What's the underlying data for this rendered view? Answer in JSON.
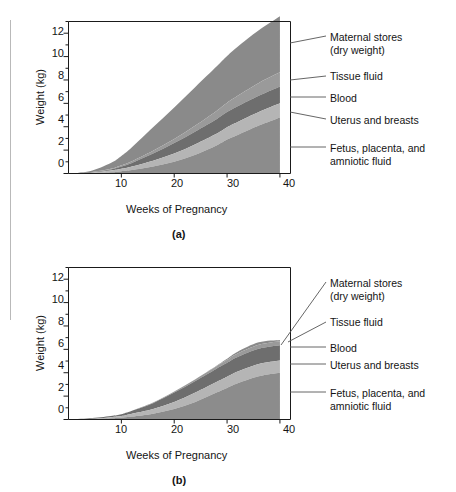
{
  "figure": {
    "panels": [
      {
        "tag": "(a)",
        "ylabel": "Weight (kg)",
        "xlabel": "Weeks of Pregnancy",
        "yticks": [
          "12",
          "10",
          "8",
          "6",
          "4",
          "2",
          "0"
        ],
        "xticks": [
          "10",
          "20",
          "30",
          "40"
        ],
        "legend": [
          "Maternal stores\n(dry weight)",
          "Tissue fluid",
          "Blood",
          "Uterus and breasts",
          "Fetus, placenta, and\namniotic fluid"
        ]
      },
      {
        "tag": "(b)",
        "ylabel": "Weight (kg)",
        "xlabel": "Weeks of Pregnancy",
        "yticks": [
          "12",
          "10",
          "8",
          "6",
          "4",
          "2",
          "0"
        ],
        "xticks": [
          "10",
          "20",
          "30",
          "40"
        ],
        "legend": [
          "Maternal stores\n(dry weight)",
          "Tissue fluid",
          "Blood",
          "Uterus and breasts",
          "Fetus, placenta, and\namniotic fluid"
        ]
      }
    ]
  },
  "colors": {
    "fetus": "#8c8c8c",
    "uterus": "#b5b5b5",
    "blood": "#6e6e6e",
    "tissue_fluid": "#9a9a9a",
    "maternal_stores": "#8a8a8a",
    "axis": "#1a1a1a",
    "leader": "#555555",
    "background": "#ffffff"
  },
  "chart_data": [
    {
      "type": "area",
      "id": "panel-a",
      "title": "(a)",
      "xlabel": "Weeks of Pregnancy",
      "ylabel": "Weight (kg)",
      "xlim": [
        0,
        42
      ],
      "ylim": [
        0,
        13
      ],
      "xticks": [
        10,
        20,
        30,
        40
      ],
      "yticks": [
        0,
        2,
        4,
        6,
        8,
        10,
        12
      ],
      "grid": false,
      "legend_position": "right-callouts",
      "stacked": true,
      "x": [
        0,
        4,
        8,
        10,
        12,
        16,
        20,
        24,
        28,
        30,
        32,
        36,
        40
      ],
      "series": [
        {
          "name": "Fetus, placenta, and amniotic fluid",
          "values": [
            0,
            0,
            0.1,
            0.2,
            0.3,
            0.6,
            1.0,
            1.6,
            2.4,
            2.9,
            3.3,
            4.1,
            4.8
          ]
        },
        {
          "name": "Uterus and breasts",
          "values": [
            0,
            0.05,
            0.15,
            0.2,
            0.3,
            0.5,
            0.7,
            0.9,
            1.0,
            1.05,
            1.1,
            1.15,
            1.2
          ]
        },
        {
          "name": "Blood",
          "values": [
            0,
            0.05,
            0.1,
            0.2,
            0.3,
            0.6,
            0.9,
            1.1,
            1.25,
            1.3,
            1.35,
            1.4,
            1.45
          ]
        },
        {
          "name": "Tissue fluid",
          "values": [
            0,
            0.0,
            0.05,
            0.1,
            0.15,
            0.25,
            0.35,
            0.5,
            0.7,
            0.8,
            0.9,
            1.1,
            1.2
          ]
        },
        {
          "name": "Maternal stores (dry weight)",
          "values": [
            0,
            0.1,
            0.5,
            0.8,
            1.2,
            2.0,
            2.7,
            3.3,
            3.8,
            4.0,
            4.2,
            4.5,
            4.8
          ]
        }
      ],
      "total_at_40": 13.5
    },
    {
      "type": "area",
      "id": "panel-b",
      "title": "(b)",
      "xlabel": "Weeks of Pregnancy",
      "ylabel": "Weight (kg)",
      "xlim": [
        0,
        42
      ],
      "ylim": [
        0,
        13
      ],
      "xticks": [
        10,
        20,
        30,
        40
      ],
      "yticks": [
        0,
        2,
        4,
        6,
        8,
        10,
        12
      ],
      "grid": false,
      "legend_position": "right-callouts",
      "stacked": true,
      "x": [
        0,
        4,
        8,
        10,
        12,
        16,
        20,
        24,
        28,
        30,
        32,
        36,
        40
      ],
      "series": [
        {
          "name": "Fetus, placenta, and amniotic fluid",
          "values": [
            0,
            0,
            0.1,
            0.15,
            0.25,
            0.5,
            0.9,
            1.5,
            2.3,
            2.7,
            3.1,
            3.7,
            4.0
          ]
        },
        {
          "name": "Uterus and breasts",
          "values": [
            0,
            0.05,
            0.1,
            0.15,
            0.25,
            0.4,
            0.6,
            0.8,
            0.9,
            0.95,
            1.0,
            1.05,
            1.05
          ]
        },
        {
          "name": "Blood",
          "values": [
            0,
            0.05,
            0.1,
            0.15,
            0.25,
            0.5,
            0.8,
            1.0,
            1.15,
            1.2,
            1.25,
            1.3,
            1.3
          ]
        },
        {
          "name": "Tissue fluid",
          "values": [
            0,
            0.0,
            0.0,
            0.0,
            0.0,
            0.05,
            0.1,
            0.15,
            0.2,
            0.25,
            0.3,
            0.35,
            0.35
          ]
        },
        {
          "name": "Maternal stores (dry weight)",
          "values": [
            0,
            0.0,
            0.0,
            0.0,
            0.0,
            0.0,
            0.0,
            0.0,
            0.05,
            0.1,
            0.15,
            0.2,
            0.1
          ]
        }
      ],
      "total_at_40": 6.8
    }
  ]
}
